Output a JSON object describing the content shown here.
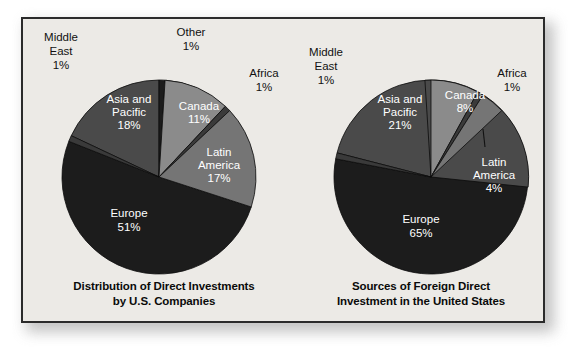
{
  "figure": {
    "background_color": "#ffffff",
    "panel_color": "#eceae6",
    "panel_border_color": "#2b2b2b"
  },
  "chart_data": [
    {
      "type": "pie",
      "title": "Distribution of Direct Investments by U.S. Companies",
      "title_line1": "Distribution of Direct Investments",
      "title_line2": "by U.S. Companies",
      "xlabel": "",
      "ylabel": "",
      "legend_position": "none",
      "grid": false,
      "start_angle_deg": 0,
      "direction": "clockwise",
      "categories": [
        "Other",
        "Canada",
        "Africa",
        "Latin America",
        "Europe",
        "Middle East",
        "Asia and Pacific"
      ],
      "values": [
        1,
        11,
        1,
        17,
        51,
        1,
        18
      ],
      "slices": [
        {
          "label": "Other",
          "label_line1": "Other",
          "value": 1,
          "value_text": "1%",
          "color": "#1c1c1c",
          "label_placement": "outside"
        },
        {
          "label": "Canada",
          "label_line1": "Canada",
          "value": 11,
          "value_text": "11%",
          "color": "#8b8b8b",
          "label_placement": "inside"
        },
        {
          "label": "Africa",
          "label_line1": "Africa",
          "value": 1,
          "value_text": "1%",
          "color": "#3a3a3a",
          "label_placement": "outside"
        },
        {
          "label": "Latin America",
          "label_line1": "Latin",
          "label_line2": "America",
          "value": 17,
          "value_text": "17%",
          "color": "#757575",
          "label_placement": "inside"
        },
        {
          "label": "Europe",
          "label_line1": "Europe",
          "value": 51,
          "value_text": "51%",
          "color": "#1c1c1c",
          "label_placement": "inside"
        },
        {
          "label": "Middle East",
          "label_line1": "Middle",
          "label_line2": "East",
          "value": 1,
          "value_text": "1%",
          "color": "#3a3a3a",
          "label_placement": "outside"
        },
        {
          "label": "Asia and Pacific",
          "label_line1": "Asia and",
          "label_line2": "Pacific",
          "value": 18,
          "value_text": "18%",
          "color": "#4a4a4a",
          "label_placement": "inside"
        }
      ]
    },
    {
      "type": "pie",
      "title": "Sources of Foreign Direct Investment in the United States",
      "title_line1": "Sources of Foreign Direct",
      "title_line2": "Investment in the United States",
      "xlabel": "",
      "ylabel": "",
      "legend_position": "none",
      "grid": false,
      "start_angle_deg": 0,
      "direction": "clockwise",
      "categories": [
        "Canada",
        "Africa",
        "Latin America",
        "Europe",
        "Middle East",
        "Asia and Pacific"
      ],
      "values": [
        8,
        1,
        4,
        65,
        1,
        21
      ],
      "slices": [
        {
          "label": "Canada",
          "label_line1": "Canada",
          "value": 8,
          "value_text": "8%",
          "color": "#8b8b8b",
          "label_placement": "inside"
        },
        {
          "label": "Africa",
          "label_line1": "Africa",
          "value": 1,
          "value_text": "1%",
          "color": "#3a3a3a",
          "label_placement": "outside"
        },
        {
          "label": "Latin America",
          "label_line1": "Latin",
          "label_line2": "America",
          "value": 4,
          "value_text": "4%",
          "color": "#757575",
          "label_placement": "outside"
        },
        {
          "label": "Europe",
          "label_line1": "Europe",
          "value": 65,
          "value_text": "65%",
          "color": "#1c1c1c",
          "label_placement": "inside"
        },
        {
          "label": "Middle East",
          "label_line1": "Middle",
          "label_line2": "East",
          "value": 1,
          "value_text": "1%",
          "color": "#3a3a3a",
          "label_placement": "outside"
        },
        {
          "label": "Asia and Pacific",
          "label_line1": "Asia and",
          "label_line2": "Pacific",
          "value": 21,
          "value_text": "21%",
          "color": "#4a4a4a",
          "label_placement": "inside"
        }
      ]
    }
  ]
}
